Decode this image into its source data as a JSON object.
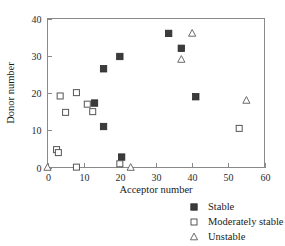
{
  "chart_data": {
    "type": "scatter",
    "title": "",
    "xlabel": "Acceptor number",
    "ylabel": "Donor number",
    "xlim": [
      0,
      60
    ],
    "ylim": [
      0,
      40
    ],
    "xticks": [
      0,
      10,
      20,
      30,
      40,
      50,
      60
    ],
    "yticks": [
      0,
      10,
      20,
      30,
      40
    ],
    "xtick_labels": [
      "0",
      "10",
      "20",
      "30",
      "40",
      "50",
      "60"
    ],
    "ytick_labels": [
      "0",
      "10",
      "20",
      "30",
      "40"
    ],
    "grid": false,
    "legend_position": "below-right",
    "series": [
      {
        "name": "Stable",
        "marker": "filled-square",
        "color": "#3b3b3b",
        "points": [
          {
            "x": 13.0,
            "y": 17.3
          },
          {
            "x": 15.5,
            "y": 26.5
          },
          {
            "x": 15.5,
            "y": 11.0
          },
          {
            "x": 20.0,
            "y": 29.8
          },
          {
            "x": 20.5,
            "y": 2.8
          },
          {
            "x": 33.5,
            "y": 36.0
          },
          {
            "x": 37.0,
            "y": 32.0
          },
          {
            "x": 41.0,
            "y": 19.0
          }
        ]
      },
      {
        "name": "Moderately stable",
        "marker": "open-square",
        "color": "#555555",
        "points": [
          {
            "x": 2.5,
            "y": 4.8
          },
          {
            "x": 3.0,
            "y": 4.0
          },
          {
            "x": 3.5,
            "y": 19.2
          },
          {
            "x": 5.0,
            "y": 14.8
          },
          {
            "x": 8.0,
            "y": 20.1
          },
          {
            "x": 8.0,
            "y": 0.1
          },
          {
            "x": 11.0,
            "y": 17.0
          },
          {
            "x": 12.5,
            "y": 15.0
          },
          {
            "x": 20.0,
            "y": 1.0
          },
          {
            "x": 53.0,
            "y": 10.5
          }
        ]
      },
      {
        "name": "Unstable",
        "marker": "open-triangle",
        "color": "#6a6a6a",
        "points": [
          {
            "x": 0.0,
            "y": 0.0
          },
          {
            "x": 23.0,
            "y": 0.0
          },
          {
            "x": 37.0,
            "y": 29.0
          },
          {
            "x": 40.0,
            "y": 36.0
          },
          {
            "x": 55.0,
            "y": 18.0
          }
        ]
      }
    ]
  },
  "legend": {
    "items": [
      {
        "label": "Stable",
        "marker": "filled-square"
      },
      {
        "label": "Moderately stable",
        "marker": "open-square"
      },
      {
        "label": "Unstable",
        "marker": "open-triangle"
      }
    ]
  }
}
